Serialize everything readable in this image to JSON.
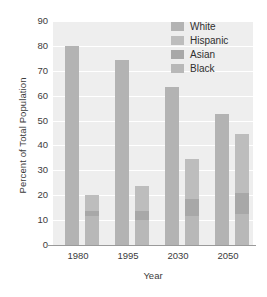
{
  "chart_data": {
    "type": "bar",
    "title": "",
    "subtitle": "",
    "xlabel": "Year",
    "ylabel": "Percent of Total Population",
    "categories": [
      "1980",
      "1995",
      "2030",
      "2050"
    ],
    "ylim": [
      0,
      90
    ],
    "yticks": [
      0,
      10,
      20,
      30,
      40,
      50,
      60,
      70,
      80,
      90
    ],
    "ytick_labels": [
      "0",
      "10",
      "20",
      "30",
      "40",
      "50",
      "60",
      "70",
      "80",
      "90"
    ],
    "grid": true,
    "grid_color": "#ffffff",
    "plot_background": "#eeeeee",
    "legend_position": "top-right",
    "legend": [
      "White",
      "Hispanic",
      "Asian",
      "Black"
    ],
    "series": [
      {
        "name": "White",
        "color": "#b3b3b3",
        "values": [
          80.0,
          74.5,
          63.5,
          52.8
        ],
        "stacked": false
      },
      {
        "name": "Hispanic",
        "color": "#bdbdbd",
        "values": [
          6.4,
          10.0,
          16.0,
          23.4
        ],
        "stacked": true
      },
      {
        "name": "Asian",
        "color": "#a8a8a8",
        "values": [
          2.1,
          3.4,
          6.6,
          8.7
        ],
        "stacked": true
      },
      {
        "name": "Black",
        "color": "#b8b8b8",
        "values": [
          11.5,
          10.2,
          11.8,
          12.4
        ],
        "stacked": true
      }
    ],
    "groups": [
      {
        "category": "1980",
        "bars": [
          {
            "name": "White",
            "total": 80.0,
            "segments": [
              {
                "label": "White",
                "value": 80.0,
                "color": "#b3b3b3"
              }
            ]
          },
          {
            "name": "Minority",
            "total": 20.0,
            "segments": [
              {
                "label": "Black",
                "value": 11.5,
                "color": "#b8b8b8"
              },
              {
                "label": "Asian",
                "value": 2.1,
                "color": "#a8a8a8"
              },
              {
                "label": "Hispanic",
                "value": 6.4,
                "color": "#bdbdbd"
              }
            ]
          }
        ]
      },
      {
        "category": "1995",
        "bars": [
          {
            "name": "White",
            "total": 74.5,
            "segments": [
              {
                "label": "White",
                "value": 74.5,
                "color": "#b3b3b3"
              }
            ]
          },
          {
            "name": "Minority",
            "total": 23.6,
            "segments": [
              {
                "label": "Black",
                "value": 10.2,
                "color": "#b8b8b8"
              },
              {
                "label": "Asian",
                "value": 3.4,
                "color": "#a8a8a8"
              },
              {
                "label": "Hispanic",
                "value": 10.0,
                "color": "#bdbdbd"
              }
            ]
          }
        ]
      },
      {
        "category": "2030",
        "bars": [
          {
            "name": "White",
            "total": 63.5,
            "segments": [
              {
                "label": "White",
                "value": 63.5,
                "color": "#b3b3b3"
              }
            ]
          },
          {
            "name": "Minority",
            "total": 34.4,
            "segments": [
              {
                "label": "Black",
                "value": 11.8,
                "color": "#b8b8b8"
              },
              {
                "label": "Asian",
                "value": 6.6,
                "color": "#a8a8a8"
              },
              {
                "label": "Hispanic",
                "value": 16.0,
                "color": "#bdbdbd"
              }
            ]
          }
        ]
      },
      {
        "category": "2050",
        "bars": [
          {
            "name": "White",
            "total": 52.8,
            "segments": [
              {
                "label": "White",
                "value": 52.8,
                "color": "#b3b3b3"
              }
            ]
          },
          {
            "name": "Minority",
            "total": 44.5,
            "segments": [
              {
                "label": "Black",
                "value": 12.4,
                "color": "#b8b8b8"
              },
              {
                "label": "Asian",
                "value": 8.7,
                "color": "#a8a8a8"
              },
              {
                "label": "Hispanic",
                "value": 23.4,
                "color": "#bdbdbd"
              }
            ]
          }
        ]
      }
    ]
  }
}
